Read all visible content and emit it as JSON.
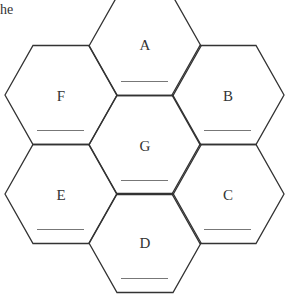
{
  "partial_text": "he",
  "hexagons": [
    {
      "label": "A",
      "cx": 145,
      "cy": 46
    },
    {
      "label": "B",
      "cx": 228,
      "cy": 95
    },
    {
      "label": "C",
      "cx": 228,
      "cy": 194
    },
    {
      "label": "D",
      "cx": 145,
      "cy": 243
    },
    {
      "label": "E",
      "cx": 61,
      "cy": 194
    },
    {
      "label": "F",
      "cx": 61,
      "cy": 95
    },
    {
      "label": "G",
      "cx": 145,
      "cy": 145
    }
  ],
  "colors": {
    "stroke": "#333333",
    "underline": "#777777"
  }
}
